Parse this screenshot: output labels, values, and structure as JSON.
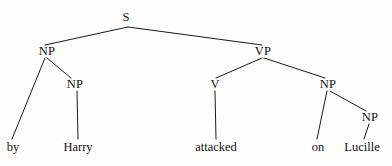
{
  "figure": {
    "kind": "constituency-syntax-tree",
    "sentence": "by Harry attacked on Lucille",
    "background_color": "#fdfdfc",
    "line_color": "#1a1a1a",
    "text_color": "#121212"
  },
  "nodes": [
    {
      "id": "s",
      "label": "S",
      "x": 126,
      "y": 17,
      "kind": "category"
    },
    {
      "id": "np-left",
      "label": "NP",
      "x": 47,
      "y": 51,
      "kind": "category"
    },
    {
      "id": "vp",
      "label": "VP",
      "x": 263,
      "y": 51,
      "kind": "category"
    },
    {
      "id": "np-harry",
      "label": "NP",
      "x": 75,
      "y": 84,
      "kind": "category"
    },
    {
      "id": "v",
      "label": "V",
      "x": 215,
      "y": 84,
      "kind": "category"
    },
    {
      "id": "np-right",
      "label": "NP",
      "x": 328,
      "y": 84,
      "kind": "category"
    },
    {
      "id": "np-luc",
      "label": "NP",
      "x": 370,
      "y": 117,
      "kind": "category"
    }
  ],
  "leaves": [
    {
      "id": "by",
      "label": "by",
      "x": 13,
      "y": 147
    },
    {
      "id": "harry",
      "label": "Harry",
      "x": 78,
      "y": 147
    },
    {
      "id": "attacked",
      "label": "attacked",
      "x": 216,
      "y": 147
    },
    {
      "id": "on",
      "label": "on",
      "x": 318,
      "y": 147
    },
    {
      "id": "lucille",
      "label": "Lucille",
      "x": 362,
      "y": 147
    }
  ],
  "edges": [
    {
      "id": "e-s-np",
      "from": "s",
      "to": "np-left",
      "x1": 128,
      "y1": 27,
      "x2": 45,
      "y2": 45
    },
    {
      "id": "e-s-vp",
      "from": "s",
      "to": "vp",
      "x1": 128,
      "y1": 27,
      "x2": 262,
      "y2": 45
    },
    {
      "id": "e-np-by",
      "from": "np-left",
      "to": "by",
      "x1": 45,
      "y1": 58,
      "x2": 12,
      "y2": 139
    },
    {
      "id": "e-np-npharry",
      "from": "np-left",
      "to": "np-harry",
      "x1": 47,
      "y1": 58,
      "x2": 71,
      "y2": 78
    },
    {
      "id": "e-npharry-w",
      "from": "np-harry",
      "to": "harry",
      "x1": 77,
      "y1": 91,
      "x2": 78,
      "y2": 139
    },
    {
      "id": "e-vp-v",
      "from": "vp",
      "to": "v",
      "x1": 262,
      "y1": 58,
      "x2": 216,
      "y2": 78
    },
    {
      "id": "e-vp-np",
      "from": "vp",
      "to": "np-right",
      "x1": 264,
      "y1": 58,
      "x2": 325,
      "y2": 78
    },
    {
      "id": "e-v-attacked",
      "from": "v",
      "to": "attacked",
      "x1": 215,
      "y1": 91,
      "x2": 216,
      "y2": 139
    },
    {
      "id": "e-np-on",
      "from": "np-right",
      "to": "on",
      "x1": 327,
      "y1": 91,
      "x2": 317,
      "y2": 139
    },
    {
      "id": "e-np-npluc",
      "from": "np-right",
      "to": "np-luc",
      "x1": 330,
      "y1": 91,
      "x2": 366,
      "y2": 111
    },
    {
      "id": "e-npluc-w",
      "from": "np-luc",
      "to": "lucille",
      "x1": 369,
      "y1": 124,
      "x2": 364,
      "y2": 139
    }
  ]
}
